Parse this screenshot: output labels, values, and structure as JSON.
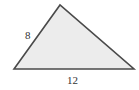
{
  "figure": {
    "shape": "triangle",
    "vertices": [
      [
        14,
        69
      ],
      [
        60,
        5
      ],
      [
        134,
        69
      ]
    ],
    "fill_color": "#ececec",
    "stroke_color": "#4a4a4a",
    "labels": {
      "left_side": "8",
      "base": "12"
    }
  }
}
